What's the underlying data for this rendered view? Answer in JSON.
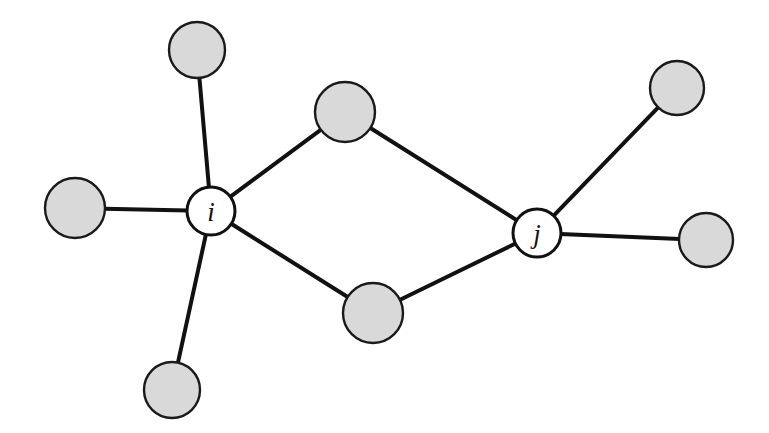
{
  "figure": {
    "kind": "network-diagram",
    "background_color": "#ffffff",
    "width": 769,
    "height": 433
  },
  "style": {
    "neighbor_fill": "#d9d9d9",
    "neighbor_stroke": "#1a1a1a",
    "hub_fill": "#ffffff",
    "hub_stroke": "#111111",
    "edge_color": "#111111",
    "edge_width": 4
  },
  "nodes": [
    {
      "id": "i",
      "label": "i",
      "type": "hub",
      "cx": 211,
      "cy": 211,
      "r": 24
    },
    {
      "id": "j",
      "label": "j",
      "type": "hub",
      "cx": 537,
      "cy": 233,
      "r": 24
    },
    {
      "id": "n1",
      "label": "",
      "type": "neighbor",
      "cx": 197,
      "cy": 50,
      "r": 28
    },
    {
      "id": "n2",
      "label": "",
      "type": "neighbor",
      "cx": 75,
      "cy": 208,
      "r": 30
    },
    {
      "id": "n3",
      "label": "",
      "type": "neighbor",
      "cx": 172,
      "cy": 390,
      "r": 28
    },
    {
      "id": "n4",
      "label": "",
      "type": "neighbor",
      "cx": 345,
      "cy": 112,
      "r": 30
    },
    {
      "id": "n5",
      "label": "",
      "type": "neighbor",
      "cx": 373,
      "cy": 313,
      "r": 30
    },
    {
      "id": "n6",
      "label": "",
      "type": "neighbor",
      "cx": 677,
      "cy": 88,
      "r": 27
    },
    {
      "id": "n7",
      "label": "",
      "type": "neighbor",
      "cx": 706,
      "cy": 240,
      "r": 27
    }
  ],
  "edges": [
    {
      "source": "i",
      "target": "n1"
    },
    {
      "source": "i",
      "target": "n2"
    },
    {
      "source": "i",
      "target": "n3"
    },
    {
      "source": "i",
      "target": "n4"
    },
    {
      "source": "i",
      "target": "n5"
    },
    {
      "source": "j",
      "target": "n4"
    },
    {
      "source": "j",
      "target": "n5"
    },
    {
      "source": "j",
      "target": "n6"
    },
    {
      "source": "j",
      "target": "n7"
    }
  ]
}
